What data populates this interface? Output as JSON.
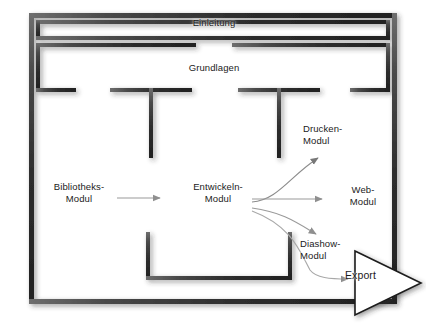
{
  "diagram": {
    "title_text": "Lightroom Modul-Workflow",
    "background_color": "#ffffff",
    "wall_color": "#3a3a3a",
    "wall_highlight_color": "#7a7a7a",
    "arrow_color": "#8c8c8c",
    "label_color": "#1b1b1b",
    "export_fill_color": "#ffffff",
    "export_stroke_color": "#1b1b1b"
  },
  "labels": {
    "einleitung": "Einleitung",
    "grundlagen": "Grundlagen",
    "bibliotheks_modul": "Bibliotheks-\nModul",
    "entwickeln_modul": "Entwickeln-\nModul",
    "drucken_modul": "Drucken-\nModul",
    "web_modul": "Web-\nModul",
    "diashow_modul": "Diashow-\nModul",
    "export": "Export"
  },
  "nodes": [
    {
      "id": "bibliotheks",
      "label": "Bibliotheks-Modul",
      "x": 79,
      "y": 192
    },
    {
      "id": "entwickeln",
      "label": "Entwickeln-Modul",
      "x": 218,
      "y": 192
    },
    {
      "id": "drucken",
      "label": "Drucken-Modul",
      "x": 330,
      "y": 134
    },
    {
      "id": "web",
      "label": "Web-Modul",
      "x": 357,
      "y": 195
    },
    {
      "id": "diashow",
      "label": "Diashow-Modul",
      "x": 334,
      "y": 249
    },
    {
      "id": "export",
      "label": "Export",
      "x": 369,
      "y": 275
    }
  ],
  "connections": [
    {
      "from": "bibliotheks",
      "to": "entwickeln",
      "style": "straight"
    },
    {
      "from": "entwickeln",
      "to": "drucken",
      "style": "curved-up"
    },
    {
      "from": "entwickeln",
      "to": "web",
      "style": "straight"
    },
    {
      "from": "entwickeln",
      "to": "diashow",
      "style": "curved-down"
    },
    {
      "from": "entwickeln",
      "to": "export",
      "style": "curved-down-long"
    }
  ],
  "bands": [
    {
      "id": "band-einleitung",
      "label": "Einleitung"
    },
    {
      "id": "band-grundlagen",
      "label": "Grundlagen"
    }
  ]
}
